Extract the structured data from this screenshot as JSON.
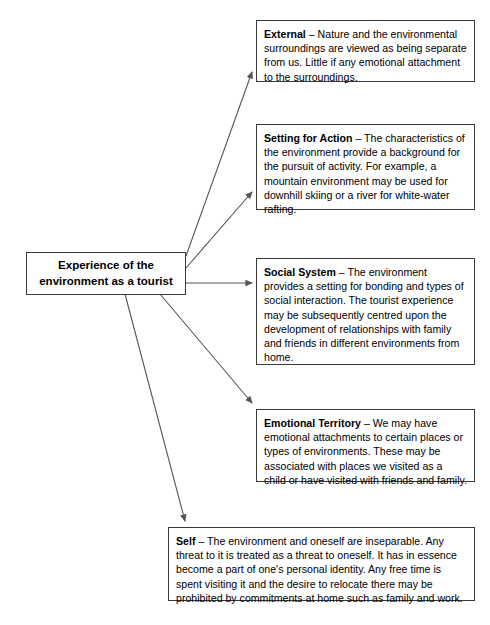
{
  "diagram": {
    "title_node": {
      "label": "Experience of the environment as a tourist",
      "line1": "Experience of the",
      "line2": "environment as a tourist"
    },
    "nodes": [
      {
        "id": "external",
        "term": "External",
        "separator": " – ",
        "body": "Nature and the environmental surroundings are viewed as being separate from us. Little if any emotional attachment to the surroundings."
      },
      {
        "id": "setting-for-action",
        "term": "Setting for Action",
        "separator": " – ",
        "body": "The characteristics of the environment provide a background for the pursuit of activity. For example, a mountain environment may be used for downhill skiing or a river for white-water rafting."
      },
      {
        "id": "social-system",
        "term": "Social System",
        "separator": " – ",
        "body": "The environment provides a setting for bonding and types of social interaction. The tourist experience may be subsequently centred upon the development of relationships with family and friends in different environments from home."
      },
      {
        "id": "emotional-territory",
        "term": "Emotional Territory",
        "separator": " – ",
        "body": "We may have emotional attachments to certain places or types of environments. These may be associated with places we visited as a child or have visited with friends and family."
      },
      {
        "id": "self",
        "term": "Self",
        "separator": " – ",
        "body": "The environment and oneself are inseparable. Any threat to it is treated as a threat to oneself. It has in essence become a part of one's personal identity. Any free time is spent visiting it and the desire to relocate there may be prohibited by commitments at home such as family and work."
      }
    ],
    "colors": {
      "border": "#3a3a3a",
      "connector": "#555555",
      "text": "#000000",
      "background": "#ffffff"
    }
  }
}
